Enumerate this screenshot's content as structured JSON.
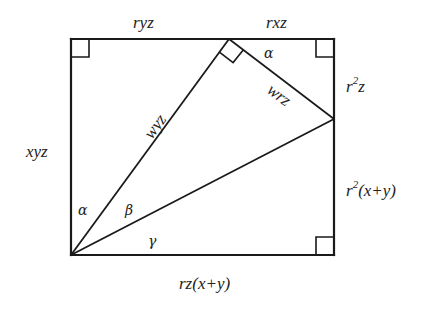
{
  "diagram": {
    "type": "geometry",
    "colors": {
      "stroke": "#1a1a1a",
      "text": "#222222",
      "background": "#ffffff"
    },
    "vertices": {
      "top_left": [
        71,
        39
      ],
      "top_apex": [
        229,
        39
      ],
      "top_right": [
        334,
        39
      ],
      "right_point": [
        334,
        119
      ],
      "bottom_right": [
        334,
        255
      ],
      "bottom_left": [
        71,
        255
      ]
    },
    "labels": {
      "top_left_segment": "ryz",
      "top_right_segment": "rxz",
      "left_side": "xyz",
      "right_upper_base": "r",
      "right_upper_exp": "2",
      "right_upper_tail": "z",
      "right_lower_base": "r",
      "right_lower_exp": "2",
      "right_lower_tail": "(x+y)",
      "bottom": "rz(x+y)",
      "hypotenuse_left": "wyz",
      "inner_segment": "wrz"
    },
    "angles": {
      "alpha_bottom": "α",
      "beta": "β",
      "gamma": "γ",
      "alpha_top": "α"
    },
    "right_angle_markers": [
      "top-left",
      "top-apex",
      "top-right",
      "bottom-right"
    ]
  }
}
